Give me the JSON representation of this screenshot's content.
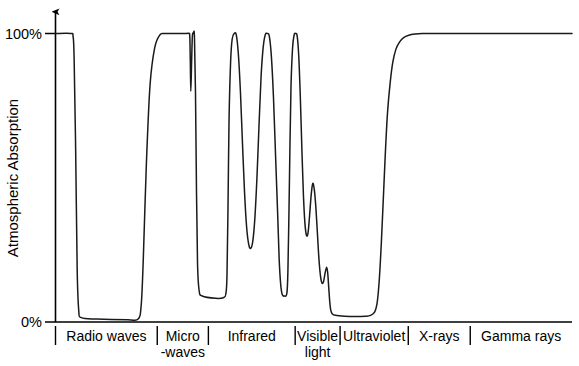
{
  "chart_data": {
    "type": "line",
    "title": "",
    "xlabel": "",
    "ylabel": "Atmospheric Absorption",
    "ylim": [
      0,
      100
    ],
    "xlim": [
      0,
      100
    ],
    "grid": false,
    "legend": null,
    "y_ticks": [
      {
        "value": 100,
        "label": "100%"
      },
      {
        "value": 0,
        "label": "0%"
      }
    ],
    "categories": [
      {
        "label": "Radio waves",
        "start": 0,
        "end": 19.7,
        "label_line2": ""
      },
      {
        "label": "Micro",
        "start": 19.7,
        "end": 29.6,
        "label_line2": "-waves"
      },
      {
        "label": "Infrared",
        "start": 29.6,
        "end": 46.4,
        "label_line2": ""
      },
      {
        "label": "Visible",
        "start": 46.4,
        "end": 55.1,
        "label_line2": "light"
      },
      {
        "label": "Ultraviolet",
        "start": 55.1,
        "end": 68.3,
        "label_line2": ""
      },
      {
        "label": "X-rays",
        "start": 68.3,
        "end": 80.3,
        "label_line2": ""
      },
      {
        "label": "Gamma rays",
        "start": 80.3,
        "end": 100,
        "label_line2": ""
      }
    ],
    "series": [
      {
        "name": "Atmospheric absorption",
        "points": [
          [
            0.0,
            100
          ],
          [
            3.0,
            100
          ],
          [
            3.4,
            99
          ],
          [
            3.6,
            92
          ],
          [
            3.9,
            60
          ],
          [
            4.2,
            18
          ],
          [
            4.5,
            4
          ],
          [
            5.0,
            1.5
          ],
          [
            8.0,
            1.0
          ],
          [
            14.0,
            0.8
          ],
          [
            16.0,
            1.0
          ],
          [
            16.6,
            6
          ],
          [
            17.0,
            22
          ],
          [
            17.6,
            55
          ],
          [
            18.3,
            82
          ],
          [
            19.2,
            95
          ],
          [
            20.2,
            99.5
          ],
          [
            21.2,
            100
          ],
          [
            25.0,
            100
          ],
          [
            25.8,
            100
          ],
          [
            26.0,
            99
          ],
          [
            26.1,
            90
          ],
          [
            26.2,
            80
          ],
          [
            26.35,
            90
          ],
          [
            26.5,
            99
          ],
          [
            26.7,
            100
          ],
          [
            26.9,
            99
          ],
          [
            27.1,
            80
          ],
          [
            27.3,
            45
          ],
          [
            27.5,
            20
          ],
          [
            27.8,
            11
          ],
          [
            28.4,
            9.0
          ],
          [
            31.0,
            8.2
          ],
          [
            32.6,
            8.5
          ],
          [
            33.0,
            10
          ],
          [
            33.2,
            16
          ],
          [
            33.4,
            40
          ],
          [
            33.6,
            70
          ],
          [
            33.9,
            90
          ],
          [
            34.2,
            98
          ],
          [
            34.6,
            100
          ],
          [
            35.0,
            99.5
          ],
          [
            35.4,
            93
          ],
          [
            35.8,
            80
          ],
          [
            36.2,
            62
          ],
          [
            36.6,
            45
          ],
          [
            37.0,
            33
          ],
          [
            37.4,
            27
          ],
          [
            37.8,
            25.5
          ],
          [
            38.2,
            28
          ],
          [
            38.6,
            36
          ],
          [
            39.0,
            50
          ],
          [
            39.4,
            68
          ],
          [
            39.8,
            85
          ],
          [
            40.2,
            95
          ],
          [
            40.6,
            99.5
          ],
          [
            41.0,
            100
          ],
          [
            41.4,
            99
          ],
          [
            41.8,
            92
          ],
          [
            42.2,
            78
          ],
          [
            42.6,
            58
          ],
          [
            43.0,
            38
          ],
          [
            43.3,
            22
          ],
          [
            43.6,
            13
          ],
          [
            43.9,
            9.5
          ],
          [
            44.3,
            9.0
          ],
          [
            44.8,
            10
          ],
          [
            45.0,
            18
          ],
          [
            45.2,
            38
          ],
          [
            45.4,
            62
          ],
          [
            45.6,
            82
          ],
          [
            45.9,
            95
          ],
          [
            46.2,
            99.5
          ],
          [
            46.5,
            100
          ],
          [
            46.8,
            99
          ],
          [
            47.1,
            92
          ],
          [
            47.4,
            78
          ],
          [
            47.7,
            60
          ],
          [
            48.0,
            44
          ],
          [
            48.3,
            34
          ],
          [
            48.6,
            30
          ],
          [
            48.9,
            31
          ],
          [
            49.2,
            37
          ],
          [
            49.5,
            44
          ],
          [
            49.8,
            48
          ],
          [
            50.1,
            46
          ],
          [
            50.4,
            40
          ],
          [
            50.7,
            31
          ],
          [
            51.0,
            22
          ],
          [
            51.3,
            16
          ],
          [
            51.6,
            13.5
          ],
          [
            51.9,
            14
          ],
          [
            52.2,
            17
          ],
          [
            52.5,
            19
          ],
          [
            52.7,
            17
          ],
          [
            52.9,
            12
          ],
          [
            53.1,
            7
          ],
          [
            53.3,
            4
          ],
          [
            53.6,
            2.8
          ],
          [
            54.2,
            2.3
          ],
          [
            56.0,
            2.0
          ],
          [
            58.0,
            1.9
          ],
          [
            60.0,
            2.0
          ],
          [
            61.0,
            2.3
          ],
          [
            61.8,
            3.5
          ],
          [
            62.3,
            7
          ],
          [
            62.7,
            15
          ],
          [
            63.1,
            28
          ],
          [
            63.5,
            44
          ],
          [
            63.9,
            60
          ],
          [
            64.3,
            73
          ],
          [
            64.8,
            83
          ],
          [
            65.3,
            90
          ],
          [
            65.9,
            94.5
          ],
          [
            66.6,
            97
          ],
          [
            67.4,
            98.6
          ],
          [
            68.4,
            99.4
          ],
          [
            69.6,
            99.8
          ],
          [
            71.0,
            100
          ],
          [
            74.0,
            100
          ],
          [
            80.0,
            100
          ],
          [
            88.0,
            100
          ],
          [
            94.0,
            100
          ],
          [
            100.0,
            100
          ]
        ]
      }
    ]
  },
  "axis": {
    "y_top_label": "100%",
    "y_bottom_label": "0%",
    "y_title": "Atmospheric Absorption"
  }
}
